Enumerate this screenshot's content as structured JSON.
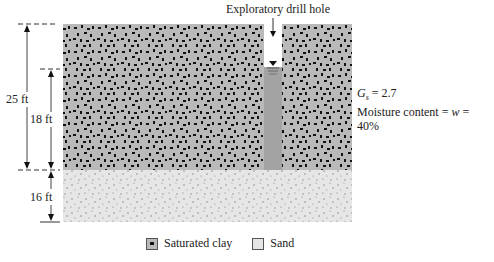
{
  "diagram": {
    "drill_hole_label": "Exploratory drill hole",
    "dimensions": {
      "total_clay": "25 ft",
      "below_water_table": "18 ft",
      "sand": "16 ft"
    },
    "properties": {
      "gs_symbol": "G",
      "gs_subscript": "s",
      "gs_value": "= 2.7",
      "moisture_label": "Moisture content = ",
      "moisture_symbol": "w",
      "moisture_value": " = 40%"
    },
    "legend": [
      {
        "label": "Saturated clay",
        "swatch": "clay"
      },
      {
        "label": "Sand",
        "swatch": "sand"
      }
    ],
    "colors": {
      "clay_fill": "#b9b9b9",
      "clay_speckle": "#111111",
      "sand_fill": "#e6e6e6",
      "sand_dot": "#7a7a7a",
      "water": "#a3a3a3",
      "line": "#333333"
    }
  }
}
